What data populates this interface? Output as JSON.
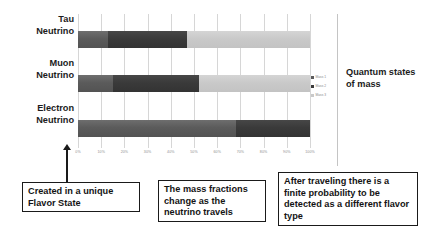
{
  "chart_data": {
    "type": "bar",
    "orientation": "horizontal",
    "stacked": true,
    "title": "",
    "xlabel": "",
    "ylabel": "",
    "xlim": [
      0,
      100
    ],
    "grid": true,
    "legend_position": "right",
    "categories": [
      "Tau Neutrino",
      "Muon Neutrino",
      "Electron Neutrino"
    ],
    "tick_labels": [
      "0%",
      "10%",
      "20%",
      "30%",
      "40%",
      "50%",
      "60%",
      "70%",
      "80%",
      "90%",
      "100%"
    ],
    "tick_values": [
      0,
      10,
      20,
      30,
      40,
      50,
      60,
      70,
      80,
      90,
      100
    ],
    "series": [
      {
        "name": "Mass 1",
        "color": "#5b5b5b",
        "values": [
          13,
          15,
          68
        ]
      },
      {
        "name": "Mass 2",
        "color": "#3a3a3a",
        "values": [
          34,
          37,
          32
        ]
      },
      {
        "name": "Mass 3",
        "color": "#c9c9c9",
        "values": [
          53,
          48,
          0
        ]
      }
    ],
    "rows": [
      {
        "category_line1": "Tau",
        "category_line2": "Neutrino",
        "segments": [
          13,
          34,
          53
        ]
      },
      {
        "category_line1": "Muon",
        "category_line2": "Neutrino",
        "segments": [
          15,
          37,
          48
        ]
      },
      {
        "category_line1": "Electron",
        "category_line2": "Neutrino",
        "segments": [
          68,
          32,
          0
        ]
      }
    ]
  },
  "legend": {
    "items": [
      {
        "label": "Mass 1",
        "color": "#5b5b5b"
      },
      {
        "label": "Mass 2",
        "color": "#3a3a3a"
      },
      {
        "label": "Mass 3",
        "color": "#c9c9c9"
      }
    ]
  },
  "right_caption": "Quantum states of mass",
  "callouts": {
    "flavor": "Created in a unique Flavor State",
    "mass_fractions": "The mass fractions change as the neutrino travels",
    "detection": "After traveling there is a finite probability to be detected as a different flavor type"
  }
}
